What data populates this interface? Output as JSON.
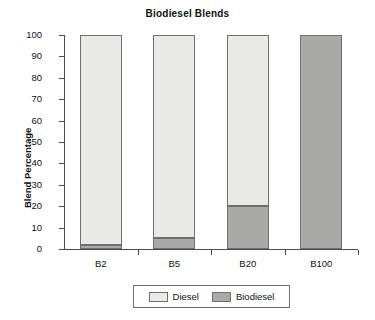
{
  "chart_data": {
    "type": "bar",
    "subtype": "stacked-bar",
    "title": "Biodiesel Blends",
    "xlabel": "",
    "ylabel": "Blend Percentage",
    "categories": [
      "B2",
      "B5",
      "B20",
      "B100"
    ],
    "series": [
      {
        "name": "Diesel",
        "values": [
          98,
          95,
          80,
          0
        ],
        "color": "#e9e9e7"
      },
      {
        "name": "Biodiesel",
        "values": [
          2,
          5,
          20,
          100
        ],
        "color": "#a9a9a7"
      }
    ],
    "ylim": [
      0,
      100
    ],
    "yticks": [
      0,
      10,
      20,
      30,
      40,
      50,
      60,
      70,
      80,
      90,
      100
    ],
    "ytick_labels": [
      "0",
      "10",
      "20",
      "30",
      "40",
      "50",
      "60",
      "70",
      "80",
      "90",
      "100"
    ],
    "grid": false,
    "legend_position": "bottom",
    "legend_entries": [
      "Diesel",
      "Biodiesel"
    ]
  },
  "legend": {
    "items": [
      {
        "label": "Diesel"
      },
      {
        "label": "Biodiesel"
      }
    ]
  }
}
